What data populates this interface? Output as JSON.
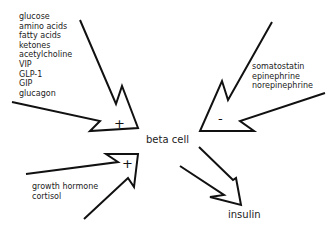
{
  "diagram": {
    "center_node": "beta cell",
    "output_node": "insulin",
    "stimulators_group1": {
      "sign": "+",
      "items": [
        "glucose",
        "amino acids",
        "fatty acids",
        "ketones",
        "acetylcholine",
        "VIP",
        "GLP-1",
        "GIP",
        "glucagon"
      ]
    },
    "inhibitors": {
      "sign": "-",
      "items": [
        "somatostatin",
        "epinephrine",
        "norepinephrine"
      ]
    },
    "stimulators_group2": {
      "sign": "+",
      "items": [
        "growth hormone",
        "cortisol"
      ]
    },
    "colors": {
      "line": "#111111",
      "text": "#222222",
      "background": "#ffffff"
    }
  }
}
